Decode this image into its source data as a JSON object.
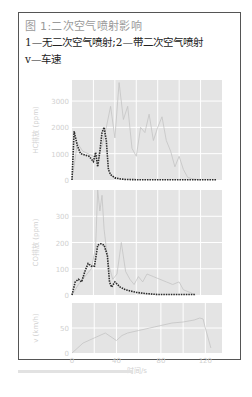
{
  "caption": {
    "title": "图 1:二次空气喷射影响",
    "legend_line1": "1—无二次空气喷射;2—带二次空气喷射",
    "legend_line2": "v—车速"
  },
  "colors": {
    "panel_bg": "#e4e4e4",
    "grid": "#ffffff",
    "series_1": "#c4c4c4",
    "series_2": "#2a2a2a",
    "axis_text": "#d0d0d0"
  },
  "chart_data": [
    {
      "type": "line",
      "panel": "top",
      "ylabel": "HC排放 (ppm)",
      "yticks": [
        0,
        1000,
        2000,
        3000
      ],
      "ylim": [
        0,
        3800
      ],
      "xlim": [
        0,
        140
      ],
      "grid": true,
      "series": [
        {
          "name": "1",
          "style": "solid-light",
          "x": [
            0,
            5,
            10,
            15,
            20,
            25,
            28,
            32,
            36,
            40,
            44,
            48,
            52,
            56,
            60,
            64,
            68,
            72,
            76,
            80,
            84,
            88,
            92,
            96,
            100,
            104,
            108,
            112,
            120
          ],
          "y": [
            0,
            1400,
            1100,
            1000,
            900,
            950,
            1300,
            2000,
            2800,
            1600,
            3700,
            2300,
            2800,
            1200,
            900,
            2000,
            1800,
            2500,
            1500,
            2000,
            2400,
            1500,
            1100,
            500,
            900,
            400,
            100,
            50,
            0
          ]
        },
        {
          "name": "2",
          "style": "dotted-dark",
          "x": [
            0,
            2,
            5,
            8,
            12,
            16,
            20,
            22,
            24,
            26,
            28,
            30,
            32,
            34,
            36,
            40,
            45,
            50,
            60,
            80,
            100,
            120,
            135
          ],
          "y": [
            0,
            1850,
            1300,
            1000,
            950,
            900,
            700,
            1050,
            500,
            1100,
            1800,
            2000,
            1500,
            400,
            200,
            80,
            40,
            20,
            10,
            10,
            10,
            10,
            10
          ]
        }
      ]
    },
    {
      "type": "line",
      "panel": "middle",
      "ylabel": "CO排放 (ppm)",
      "yticks": [
        0,
        100,
        200,
        300
      ],
      "ylim": [
        0,
        400
      ],
      "xlim": [
        0,
        140
      ],
      "grid": true,
      "series": [
        {
          "name": "1",
          "style": "solid-light",
          "x": [
            0,
            6,
            10,
            14,
            18,
            22,
            24,
            26,
            28,
            30,
            32,
            34,
            38,
            42,
            46,
            50,
            54,
            58,
            62,
            66,
            70,
            76,
            82,
            88,
            94,
            100,
            104,
            110,
            115
          ],
          "y": [
            0,
            40,
            60,
            80,
            100,
            180,
            400,
            320,
            380,
            250,
            180,
            120,
            60,
            80,
            200,
            90,
            60,
            40,
            70,
            50,
            80,
            70,
            60,
            50,
            40,
            50,
            20,
            10,
            0
          ]
        },
        {
          "name": "2",
          "style": "dotted-dark",
          "x": [
            0,
            3,
            6,
            9,
            12,
            15,
            18,
            21,
            24,
            27,
            30,
            33,
            35,
            37,
            40,
            45,
            50,
            55,
            60,
            70,
            80,
            90,
            100,
            110,
            115
          ],
          "y": [
            0,
            50,
            60,
            50,
            90,
            120,
            110,
            110,
            190,
            195,
            190,
            150,
            50,
            30,
            50,
            30,
            20,
            15,
            10,
            5,
            2,
            2,
            2,
            2,
            2
          ]
        }
      ]
    },
    {
      "type": "line",
      "panel": "bottom",
      "ylabel": "v (km/h)",
      "yticks": [
        0,
        50
      ],
      "ylim": [
        0,
        100
      ],
      "xlabel": "时间/s",
      "xticks": [
        0,
        40,
        80,
        120
      ],
      "xlim": [
        0,
        135
      ],
      "grid": true,
      "series": [
        {
          "name": "v",
          "style": "solid-light",
          "x": [
            0,
            5,
            10,
            20,
            30,
            40,
            45,
            50,
            60,
            70,
            80,
            90,
            100,
            110,
            115,
            118,
            120,
            125
          ],
          "y": [
            0,
            10,
            20,
            30,
            40,
            25,
            35,
            40,
            45,
            50,
            55,
            60,
            62,
            66,
            70,
            68,
            50,
            10
          ]
        }
      ]
    }
  ]
}
